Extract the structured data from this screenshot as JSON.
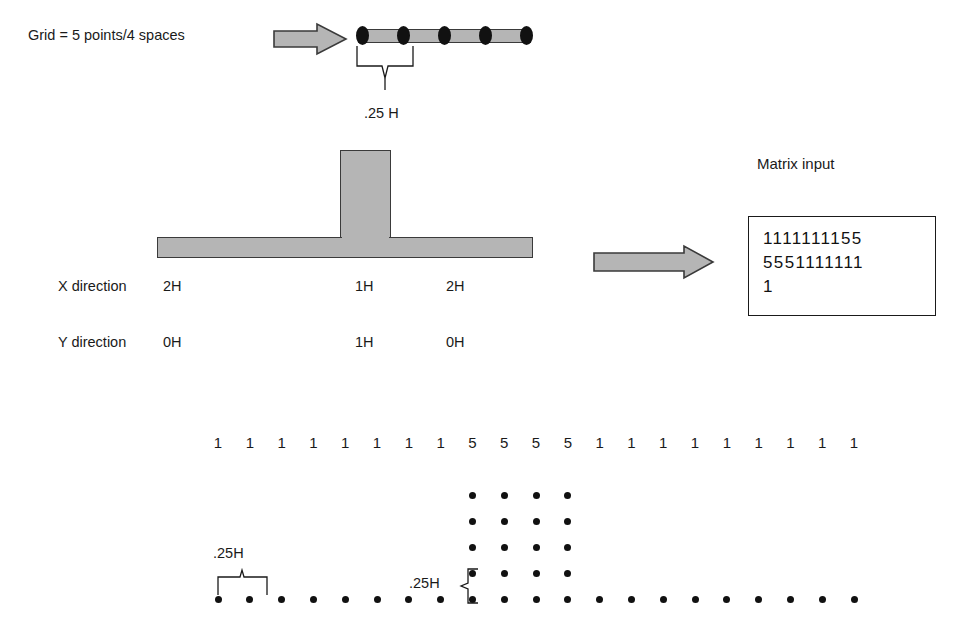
{
  "figure": {
    "top_row": {
      "grid_label": "Grid = 5 points/4 spaces",
      "arrow": "right-arrow",
      "grid_points": 5,
      "grid_spaces": 4,
      "spacing_label": ".25 H"
    },
    "profile": {
      "shape": "T-section",
      "arrow": "right-arrow",
      "rows": [
        {
          "name": "X direction",
          "values": [
            "2H",
            "1H",
            "2H"
          ]
        },
        {
          "name": "Y direction",
          "values": [
            "0H",
            "1H",
            "0H"
          ]
        }
      ]
    },
    "matrix": {
      "title": "Matrix input",
      "lines": [
        "1111111155",
        "5551111111",
        "1"
      ],
      "text": "1111111155\n5551111111\n1"
    },
    "mesh": {
      "values": [
        1,
        1,
        1,
        1,
        1,
        1,
        1,
        1,
        5,
        5,
        5,
        5,
        1,
        1,
        1,
        1,
        1,
        1,
        1,
        1,
        1
      ],
      "horizontal_spacing_label": ".25H",
      "vertical_spacing_label": ".25H",
      "baseline_dots": 21,
      "stem_columns": 4,
      "stem_rows_above_baseline": 4
    }
  },
  "colors": {
    "shape_fill": "#b5b5b5",
    "shape_stroke": "#3a3a3a",
    "ink": "#1a1a1a",
    "dot": "#111111",
    "background": "#ffffff"
  }
}
